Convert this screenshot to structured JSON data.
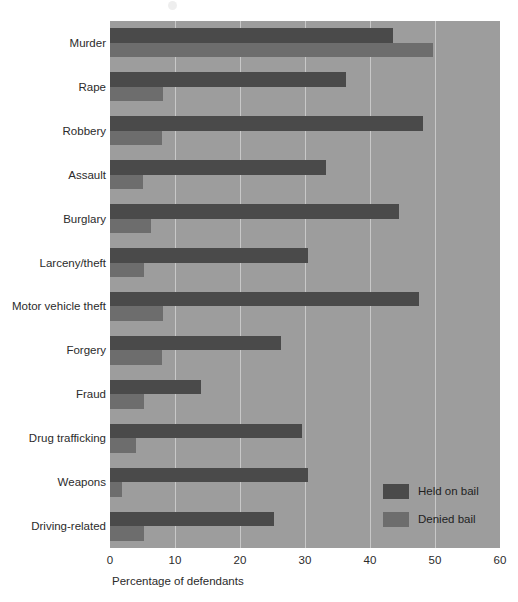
{
  "chart_data": {
    "type": "bar",
    "orientation": "horizontal",
    "title": "",
    "xlabel": "Percentage of defendants",
    "ylabel": "",
    "xlim": [
      0,
      60
    ],
    "xticks": [
      0,
      10,
      20,
      30,
      40,
      50,
      60
    ],
    "grid": true,
    "legend_position": "inside-bottom-right",
    "categories": [
      "Murder",
      "Rape",
      "Robbery",
      "Assault",
      "Burglary",
      "Larceny/theft",
      "Motor vehicle theft",
      "Forgery",
      "Fraud",
      "Drug trafficking",
      "Weapons",
      "Driving-related"
    ],
    "series": [
      {
        "name": "Held on bail",
        "color": "#4a4a4a",
        "values": [
          43.5,
          36.3,
          48.2,
          33.3,
          44.5,
          30.5,
          47.5,
          26.3,
          14.0,
          29.5,
          30.5,
          25.3
        ]
      },
      {
        "name": "Denied bail",
        "color": "#6d6d6d",
        "values": [
          49.7,
          8.2,
          8.0,
          5.0,
          6.3,
          5.3,
          8.2,
          8.0,
          5.3,
          4.0,
          1.8,
          5.3
        ]
      }
    ]
  },
  "legend": {
    "items": [
      {
        "label": "Held on bail",
        "swatch": "held"
      },
      {
        "label": "Denied bail",
        "swatch": "denied"
      }
    ]
  },
  "colors": {
    "plot_background": "#9d9d9d",
    "gridline": "#c8c8c8",
    "held_on_bail": "#4a4a4a",
    "denied_bail": "#6d6d6d",
    "text": "#2b2b2b"
  }
}
